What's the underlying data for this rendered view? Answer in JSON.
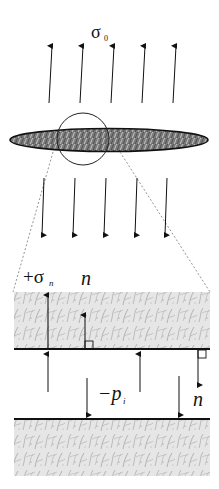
{
  "diagram": {
    "labels": {
      "far_field_stress": "σ",
      "far_field_stress_sub": "0",
      "normal_stress_sign": "+σ",
      "normal_stress_sub": "n",
      "normal_vector_upper": "n",
      "internal_pressure_sign": "−p",
      "internal_pressure_sub": "i",
      "normal_vector_lower": "n"
    },
    "elements": {
      "top_arrows_count": 5,
      "bottom_arrows_count": 5,
      "ellipse": "crack / inclusion (hatched dark grey)",
      "zoom_circle": "magnified region",
      "upper_block": "upper crack face (textured rock)",
      "lower_block": "lower crack face (textured rock)"
    },
    "colors": {
      "line": "#111111",
      "ellipse_fill": "#6e6e6e",
      "block_fill": "#e4e4e4",
      "dashed": "#888888"
    }
  }
}
